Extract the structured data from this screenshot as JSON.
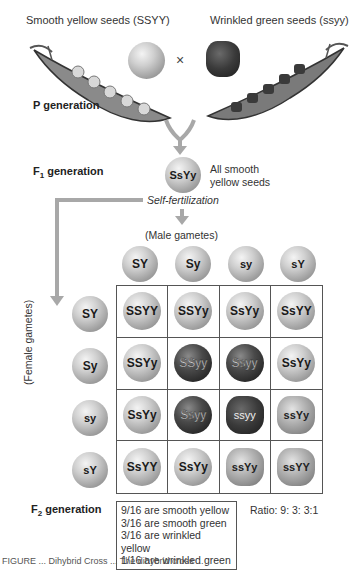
{
  "parents": {
    "left_label": "Smooth yellow seeds (SSYY)",
    "right_label": "Wrinkled green seeds (ssyy)",
    "cross_symbol": "×"
  },
  "generations": {
    "p_label": "P generation",
    "f1_label_main": "F",
    "f1_label_sub": "1",
    "f1_label_rest": " generation",
    "f1_genotype": "SsYy",
    "f1_description_line1": "All smooth",
    "f1_description_line2": "yellow seeds",
    "self_fertilization": "Self-fertilization",
    "f2_label_main": "F",
    "f2_label_sub": "2",
    "f2_label_rest": " generation"
  },
  "punnett": {
    "male_label": "(Male gametes)",
    "female_label": "(Female gametes)",
    "male_gametes": [
      "SY",
      "Sy",
      "sy",
      "sY"
    ],
    "female_gametes": [
      "SY",
      "Sy",
      "sy",
      "sY"
    ],
    "cells": [
      [
        {
          "g": "SSYY",
          "type": "smooth-yellow"
        },
        {
          "g": "SSYy",
          "type": "smooth-yellow"
        },
        {
          "g": "SsYy",
          "type": "smooth-yellow"
        },
        {
          "g": "SsYY",
          "type": "smooth-yellow"
        }
      ],
      [
        {
          "g": "SSYy",
          "type": "smooth-yellow"
        },
        {
          "g": "SSyy",
          "type": "smooth-green"
        },
        {
          "g": "Ssyy",
          "type": "smooth-green"
        },
        {
          "g": "SsYy",
          "type": "smooth-yellow"
        }
      ],
      [
        {
          "g": "SsYy",
          "type": "smooth-yellow"
        },
        {
          "g": "Ssyy",
          "type": "smooth-green"
        },
        {
          "g": "ssyy",
          "type": "wrinkled-green"
        },
        {
          "g": "ssYy",
          "type": "wrinkled-yellow"
        }
      ],
      [
        {
          "g": "SsYY",
          "type": "smooth-yellow"
        },
        {
          "g": "SsYy",
          "type": "smooth-yellow"
        },
        {
          "g": "ssYy",
          "type": "wrinkled-yellow"
        },
        {
          "g": "ssYY",
          "type": "wrinkled-yellow"
        }
      ]
    ]
  },
  "results": {
    "lines": [
      "9/16 are smooth yellow",
      "3/16 are smooth green",
      "3/16 are wrinkled yellow",
      "1/16 are wrinkled green"
    ],
    "ratio": "Ratio: 9: 3: 3:1"
  },
  "caption": "FIGURE ... Dihybrid Cross ... The dihybrid cross ..."
}
